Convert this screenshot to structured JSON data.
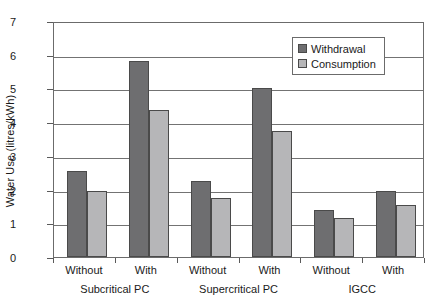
{
  "chart_data": {
    "type": "bar",
    "title": "",
    "xlabel": "",
    "ylabel": "Water Use (litres/kWh)",
    "ylim": [
      0,
      7
    ],
    "yticks": [
      0,
      1,
      2,
      3,
      4,
      5,
      6,
      7
    ],
    "ytick_labels": [
      "0",
      "1",
      "2",
      "3",
      "4",
      "5",
      "6",
      "7"
    ],
    "grid": true,
    "legend_position": "top-right",
    "categories": [
      "Without",
      "With",
      "Without",
      "With",
      "Without",
      "With"
    ],
    "groups": [
      {
        "label": "Subcritical PC",
        "categories": [
          "Without",
          "With"
        ]
      },
      {
        "label": "Supercritical PC",
        "categories": [
          "Without",
          "With"
        ]
      },
      {
        "label": "IGCC",
        "categories": [
          "Without",
          "With"
        ]
      }
    ],
    "series": [
      {
        "name": "Withdrawal",
        "color": "#6e6e70",
        "values": [
          2.55,
          5.8,
          2.25,
          5.0,
          1.4,
          1.95
        ]
      },
      {
        "name": "Consumption",
        "color": "#b6b6b8",
        "values": [
          1.95,
          4.35,
          1.75,
          3.75,
          1.15,
          1.55
        ]
      }
    ]
  },
  "legend": {
    "items": [
      {
        "label": "Withdrawal",
        "swatch": "withdrawal"
      },
      {
        "label": "Consumption",
        "swatch": "consumption"
      }
    ]
  },
  "axis": {
    "y_title": "Water Use (litres/kWh)"
  }
}
